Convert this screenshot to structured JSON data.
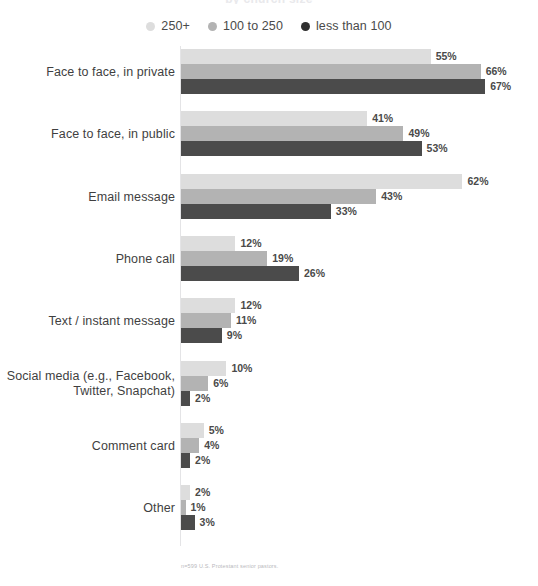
{
  "chart_data": {
    "type": "bar",
    "orientation": "horizontal",
    "title": "by church size",
    "subtitle": "",
    "xlabel": "",
    "ylabel": "",
    "xlim": [
      0,
      70
    ],
    "grid": false,
    "legend_position": "top-center",
    "value_suffix": "%",
    "categories": [
      "Face to face, in private",
      "Face to face, in public",
      "Email message",
      "Phone call",
      "Text / instant message",
      "Social media (e.g., Facebook, Twitter, Snapchat)",
      "Comment card",
      "Other"
    ],
    "category_lines": [
      [
        "Face to face, in private"
      ],
      [
        "Face to face, in public"
      ],
      [
        "Email message"
      ],
      [
        "Phone call"
      ],
      [
        "Text / instant message"
      ],
      [
        "Social media (e.g., Facebook,",
        "Twitter, Snapchat)"
      ],
      [
        "Comment card"
      ],
      [
        "Other"
      ]
    ],
    "series": [
      {
        "name": "250+",
        "color": "#dddddd",
        "values": [
          55,
          41,
          62,
          12,
          12,
          10,
          5,
          2
        ],
        "labels": [
          "55%",
          "41%",
          "62%",
          "12%",
          "12%",
          "10%",
          "5%",
          "2%"
        ]
      },
      {
        "name": "100 to 250",
        "color": "#b3b3b3",
        "values": [
          66,
          49,
          43,
          19,
          11,
          6,
          4,
          1
        ],
        "labels": [
          "66%",
          "49%",
          "43%",
          "19%",
          "11%",
          "6%",
          "4%",
          "1%"
        ]
      },
      {
        "name": "less than 100",
        "color": "#4b4b4b",
        "values": [
          67,
          53,
          33,
          26,
          9,
          2,
          2,
          3
        ],
        "labels": [
          "67%",
          "53%",
          "33%",
          "26%",
          "9%",
          "2%",
          "2%",
          "3%"
        ]
      }
    ],
    "footnote": "n=599 U.S. Protestant senior pastors."
  },
  "legend": {
    "items": [
      {
        "label": "250+",
        "color": "#dddddd"
      },
      {
        "label": "100 to 250",
        "color": "#b3b3b3"
      },
      {
        "label": "less than 100",
        "color": "#2f2f2f"
      }
    ]
  }
}
